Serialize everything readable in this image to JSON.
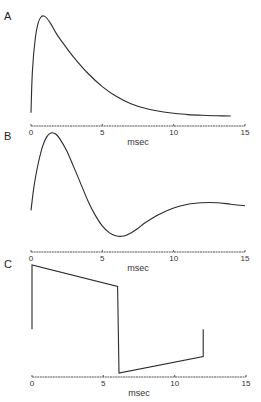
{
  "chart_data": [
    {
      "type": "line",
      "panel_label": "A",
      "xlabel": "msec",
      "xlim": [
        0,
        15
      ],
      "xticks": [
        0,
        5,
        10,
        15
      ],
      "xtick_labels": [
        "0",
        "5",
        "10",
        "15"
      ],
      "ylim": [
        0,
        1
      ],
      "show_xlabel": false,
      "series": [
        {
          "name": "A",
          "x": [
            0,
            0.1,
            0.3,
            0.5,
            0.7,
            0.9,
            1.1,
            1.4,
            1.8,
            2.2,
            3,
            4,
            5,
            6,
            7,
            8,
            9,
            10,
            11,
            12,
            13,
            14
          ],
          "y": [
            0.04,
            0.45,
            0.78,
            0.93,
            0.99,
            1.0,
            0.98,
            0.92,
            0.82,
            0.74,
            0.59,
            0.43,
            0.3,
            0.2,
            0.13,
            0.085,
            0.055,
            0.035,
            0.022,
            0.015,
            0.01,
            0.008
          ]
        }
      ]
    },
    {
      "type": "line",
      "panel_label": "B",
      "xlabel": "msec",
      "xlim": [
        0,
        15
      ],
      "xticks": [
        0,
        5,
        10,
        15
      ],
      "xtick_labels": [
        "0",
        "5",
        "10",
        "15"
      ],
      "ylim": [
        -0.35,
        1
      ],
      "show_xlabel": true,
      "series": [
        {
          "name": "B",
          "x": [
            0,
            0.2,
            0.5,
            0.8,
            1.1,
            1.4,
            1.7,
            2.0,
            2.5,
            3,
            3.5,
            4,
            4.5,
            5,
            5.5,
            6,
            6.5,
            7,
            7.5,
            8,
            9,
            10,
            11,
            12,
            13,
            14,
            15
          ],
          "y": [
            0.0,
            0.3,
            0.6,
            0.82,
            0.95,
            1.0,
            0.99,
            0.93,
            0.77,
            0.56,
            0.34,
            0.12,
            -0.06,
            -0.2,
            -0.29,
            -0.33,
            -0.33,
            -0.29,
            -0.23,
            -0.16,
            -0.05,
            0.03,
            0.08,
            0.1,
            0.1,
            0.08,
            0.06
          ]
        }
      ]
    },
    {
      "type": "line",
      "panel_label": "C",
      "xlabel": "msec",
      "xlim": [
        0,
        15
      ],
      "xticks": [
        0,
        5,
        10,
        15
      ],
      "xtick_labels": [
        "0",
        "5",
        "10",
        "15"
      ],
      "ylim": [
        -1,
        1
      ],
      "show_xlabel": true,
      "series": [
        {
          "name": "C",
          "x": [
            0,
            0,
            6,
            6.1,
            12,
            12
          ],
          "y": [
            0.0,
            0.66,
            0.44,
            -0.45,
            -0.28,
            0.0
          ]
        }
      ]
    }
  ]
}
